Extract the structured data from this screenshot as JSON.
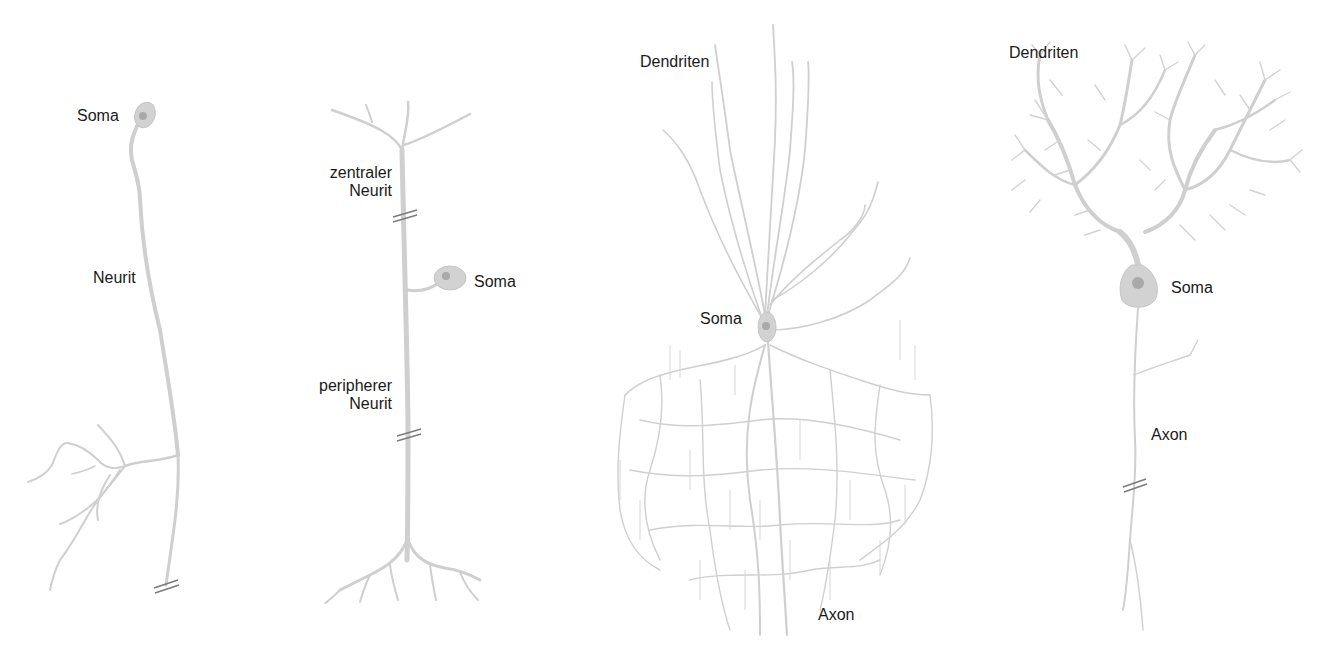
{
  "figure": {
    "panels": [
      {
        "id": "unipolar",
        "labels": {
          "soma": "Soma",
          "neurit": "Neurit"
        }
      },
      {
        "id": "pseudounipolar",
        "labels": {
          "central_line1": "zentraler",
          "central_line2": "Neurit",
          "soma": "Soma",
          "peripheral_line1": "peripherer",
          "peripheral_line2": "Neurit"
        }
      },
      {
        "id": "pyramidal",
        "labels": {
          "dendrites": "Dendriten",
          "soma": "Soma",
          "axon": "Axon"
        }
      },
      {
        "id": "purkinje",
        "labels": {
          "dendrites": "Dendriten",
          "soma": "Soma",
          "axon": "Axon"
        }
      }
    ],
    "colors": {
      "neuron_stroke": "#cfcfcf",
      "soma_fill": "#d2d2d2",
      "nucleus": "#a9a9a9",
      "cut_mark": "#7a7a7a",
      "label_text": "#1a1a1a",
      "background": "#ffffff"
    }
  }
}
